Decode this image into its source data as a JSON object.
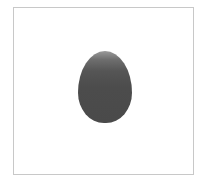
{
  "canvas": {
    "background": "#ffffff",
    "border_color": "#c8c8c8"
  },
  "shape": {
    "kind": "egg-shaped blob",
    "color_top": "#9a9a9a",
    "color_bottom": "#4a4a4a"
  }
}
